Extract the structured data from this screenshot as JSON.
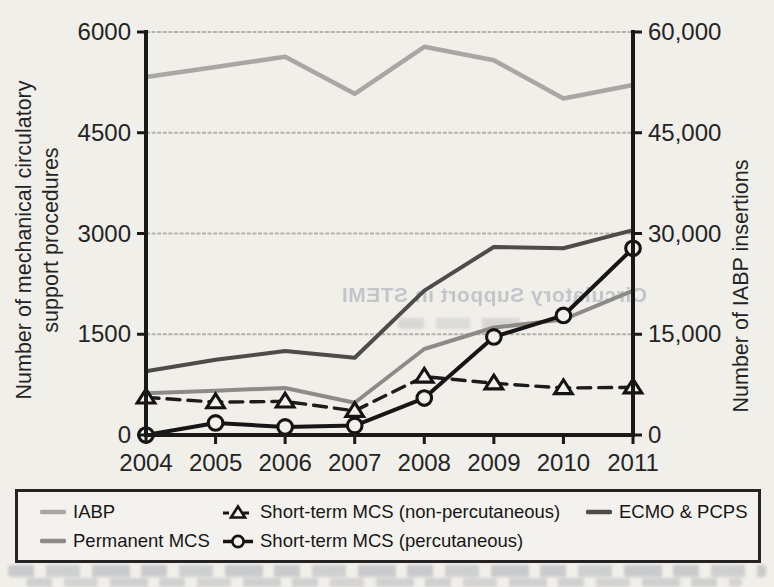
{
  "chart_data": {
    "type": "line",
    "x": [
      2004,
      2005,
      2006,
      2007,
      2008,
      2009,
      2010,
      2011
    ],
    "left_axis": {
      "label": "Number of mechanical circulatory support procedures",
      "label_lines": [
        "Number of mechanical circulatory",
        "support procedures"
      ],
      "ticks": [
        0,
        1500,
        3000,
        4500,
        6000
      ],
      "tick_labels": [
        "0",
        "1500",
        "3000",
        "4500",
        "6000"
      ],
      "range": [
        0,
        6000
      ]
    },
    "right_axis": {
      "label": "Number of IABP insertions",
      "ticks": [
        0,
        15000,
        30000,
        45000,
        60000
      ],
      "tick_labels": [
        "0",
        "15,000",
        "30,000",
        "45,000",
        "60,000"
      ],
      "range": [
        0,
        60000
      ]
    },
    "series": [
      {
        "name": "IABP",
        "axis": "right",
        "color": "#a9a7a3",
        "width": 4.5,
        "dash": null,
        "marker": null,
        "values": [
          53300,
          54800,
          56300,
          50800,
          57800,
          55800,
          50100,
          52100
        ]
      },
      {
        "name": "Permanent MCS",
        "axis": "left",
        "color": "#8d8b88",
        "width": 4,
        "dash": null,
        "marker": null,
        "values": [
          620,
          660,
          700,
          480,
          1280,
          1600,
          1720,
          2150
        ]
      },
      {
        "name": "Short-term MCS (non-percutaneous)",
        "axis": "left",
        "color": "#1c1c1c",
        "width": 3.4,
        "dash": "13 8",
        "marker": "triangle",
        "values": [
          560,
          490,
          500,
          360,
          870,
          770,
          700,
          710
        ]
      },
      {
        "name": "Short-term MCS (percutaneous)",
        "axis": "left",
        "color": "#161616",
        "width": 4,
        "dash": null,
        "marker": "circle",
        "values": [
          0,
          180,
          120,
          140,
          550,
          1460,
          1780,
          2780
        ]
      },
      {
        "name": "ECMO & PCPS",
        "axis": "left",
        "color": "#4d4c4a",
        "width": 4,
        "dash": null,
        "marker": null,
        "values": [
          950,
          1120,
          1250,
          1150,
          2150,
          2800,
          2780,
          3050
        ]
      }
    ],
    "draw_order": [
      0,
      1,
      4,
      2,
      3
    ],
    "grid": true,
    "legend_position": "bottom"
  },
  "legend": {
    "items": [
      {
        "label": "IABP"
      },
      {
        "label": "Permanent MCS"
      },
      {
        "label": "Short-term MCS (non-percutaneous)"
      },
      {
        "label": "Short-term MCS (percutaneous)"
      },
      {
        "label": "ECMO & PCPS"
      }
    ]
  },
  "scan_artifacts": {
    "ghost_title": "Circulatory Support in STEMI"
  }
}
